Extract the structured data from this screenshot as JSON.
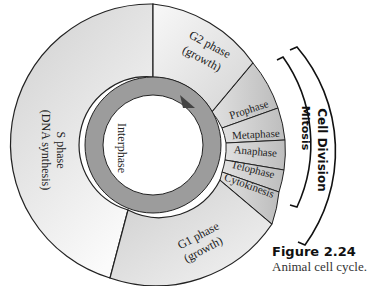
{
  "diagram": {
    "title": "Animal cell cycle",
    "center_label": "Interphase",
    "phases": [
      {
        "id": "s",
        "line1": "S phase",
        "line2": "(DNA synthesis)",
        "color": "#d8d8d8"
      },
      {
        "id": "g2",
        "line1": "G2 phase",
        "line2": "(growth)",
        "color": "#ececec"
      },
      {
        "id": "g1",
        "line1": "G1 phase",
        "line2": "(growth)",
        "color": "#d2d2d2"
      }
    ],
    "mitosis_stages": [
      {
        "label": "Prophase"
      },
      {
        "label": "Metaphase"
      },
      {
        "label": "Anaphase"
      },
      {
        "label": "Telophase"
      },
      {
        "label": "Cytokinesis"
      }
    ],
    "brackets": {
      "inner": "Mitosis",
      "outer": "Cell Division"
    },
    "colors": {
      "ring": "#9c9c9c",
      "mitosis": "#c8c8c8",
      "outline": "#222222"
    }
  },
  "caption": {
    "figure": "Figure 2.24",
    "text": "Animal cell cycle."
  }
}
